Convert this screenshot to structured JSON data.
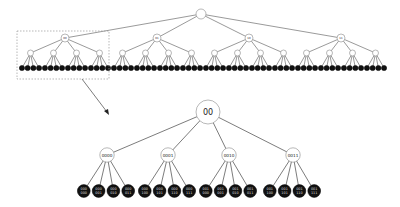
{
  "overview_tree": {
    "root_label": "",
    "level1_labels": [
      "00",
      "01",
      "10",
      "11"
    ],
    "level2_per_node": 4,
    "leaves_per_level2": 4,
    "highlight_box_target": "00"
  },
  "detail_tree": {
    "root_label": "00",
    "children": [
      {
        "label": "0000",
        "leaves": [
          "000\n000",
          "000\n001",
          "000\n010",
          "000\n011"
        ]
      },
      {
        "label": "0001",
        "leaves": [
          "000\n100",
          "000\n101",
          "000\n110",
          "000\n111"
        ]
      },
      {
        "label": "0010",
        "leaves": [
          "001\n000",
          "001\n001",
          "001\n010",
          "001\n011"
        ]
      },
      {
        "label": "0011",
        "leaves": [
          "001\n100",
          "001\n101",
          "001\n110",
          "001\n111"
        ]
      }
    ]
  },
  "colors": {
    "edge": "#555555",
    "inner_node_fill": "#ffffff",
    "leaf_fill": "#111111",
    "box_dash": "#999999"
  }
}
